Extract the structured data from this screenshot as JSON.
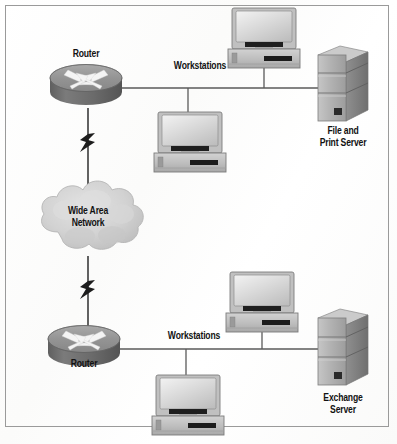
{
  "figure": {
    "kind": "network-topology-diagram",
    "border_color": "#9a9a9a",
    "background_color": "#fdfdfd",
    "line_color": "#555555"
  },
  "palette": {
    "router_top": "#9d9d9d",
    "router_body": "#6e6e6e",
    "router_arrow": "#f2f2f2",
    "server_front": "#b4b4b4",
    "server_side": "#8c8c8c",
    "server_top": "#cfcfcf",
    "monitor_bezel": "#b9b9b9",
    "monitor_screen": "#dcdcdc",
    "case_body": "#c2c2c2",
    "cloud_fill": "#d2d2d2",
    "dark_accent": "#1d1d1d"
  },
  "nodes": {
    "router_top": {
      "label": "Router",
      "label_position": "above"
    },
    "router_bottom": {
      "label": "Router",
      "label_position": "below"
    },
    "cloud": {
      "label": "Wide Area\nNetwork"
    },
    "server_top": {
      "label": "File and\nPrint Server"
    },
    "server_bottom": {
      "label": "Exchange\nServer"
    },
    "workstations_top": {
      "label": "Workstations",
      "count": 2
    },
    "workstations_bottom": {
      "label": "Workstations",
      "count": 2
    }
  },
  "links": [
    {
      "from": "router_top",
      "to": "cloud",
      "style": "wan-lightning"
    },
    {
      "from": "cloud",
      "to": "router_bottom",
      "style": "wan-lightning"
    },
    {
      "from": "router_top",
      "to": "server_top",
      "style": "bus"
    },
    {
      "from": "router_bottom",
      "to": "server_bottom",
      "style": "bus"
    }
  ]
}
